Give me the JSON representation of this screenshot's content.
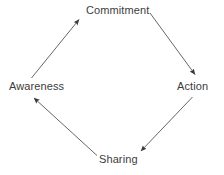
{
  "diagram": {
    "type": "cycle",
    "direction": "clockwise",
    "background_color": "#ffffff",
    "line_color": "#555555",
    "text_color": "#3c3c3c",
    "nodes": [
      {
        "id": "commitment",
        "label": "Commitment",
        "position": "top"
      },
      {
        "id": "action",
        "label": "Action",
        "position": "right"
      },
      {
        "id": "sharing",
        "label": "Sharing",
        "position": "bottom"
      },
      {
        "id": "awareness",
        "label": "Awareness",
        "position": "left"
      }
    ],
    "edges": [
      {
        "from": "awareness",
        "to": "commitment",
        "arrowhead": "end"
      },
      {
        "from": "commitment",
        "to": "action",
        "arrowhead": "end"
      },
      {
        "from": "action",
        "to": "sharing",
        "arrowhead": "end"
      },
      {
        "from": "sharing",
        "to": "awareness",
        "arrowhead": "end"
      }
    ]
  }
}
